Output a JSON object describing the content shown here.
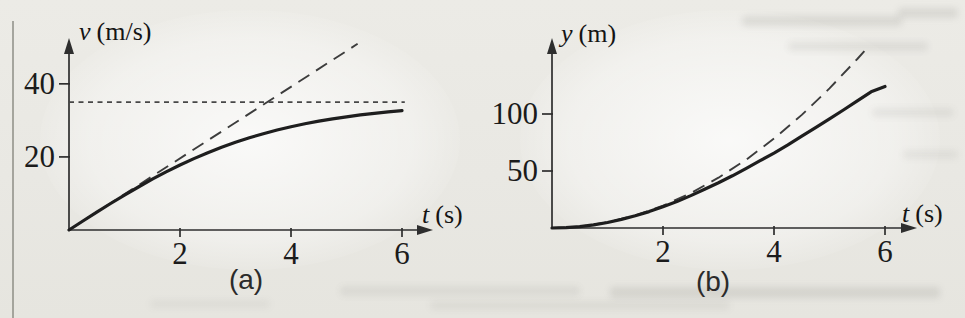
{
  "chart_data": [
    {
      "type": "line",
      "panel": "(a)",
      "xlabel_var": "t",
      "xlabel_unit": "(s)",
      "ylabel_var": "v",
      "ylabel_unit": "(m/s)",
      "xticks": [
        2,
        4,
        6
      ],
      "yticks": [
        20,
        40
      ],
      "xlim": [
        0,
        6.5
      ],
      "ylim": [
        0,
        52.5
      ],
      "grid": false,
      "legend": "none",
      "series": [
        {
          "name": "long-dashed-line",
          "style": "long-dash",
          "x": [
            0,
            5.2
          ],
          "y": [
            0,
            50.96
          ]
        },
        {
          "name": "dotted-horizontal-line",
          "style": "dotted",
          "x": [
            0,
            6.05
          ],
          "y": [
            35,
            35
          ]
        },
        {
          "name": "solid-curve",
          "style": "solid",
          "x": [
            0,
            0.25,
            0.5,
            0.75,
            1,
            1.25,
            1.5,
            1.75,
            2,
            2.25,
            2.5,
            2.75,
            3,
            3.25,
            3.5,
            3.75,
            4,
            4.25,
            4.5,
            4.75,
            5,
            5.25,
            5.5,
            5.75,
            6
          ],
          "y": [
            0,
            2.45,
            4.87,
            7.24,
            9.55,
            11.77,
            13.89,
            15.9,
            17.78,
            19.53,
            21.15,
            22.64,
            24.0,
            25.24,
            26.36,
            27.36,
            28.27,
            29.07,
            29.79,
            30.42,
            30.99,
            31.49,
            31.92,
            32.31,
            32.65
          ]
        }
      ]
    },
    {
      "type": "line",
      "panel": "(b)",
      "xlabel_var": "t",
      "xlabel_unit": "(s)",
      "ylabel_var": "y",
      "ylabel_unit": "(m)",
      "xticks": [
        2,
        4,
        6
      ],
      "yticks": [
        50,
        100
      ],
      "xlim": [
        0,
        6.55
      ],
      "ylim": [
        0,
        166
      ],
      "grid": false,
      "legend": "none",
      "series": [
        {
          "name": "long-dashed-curve",
          "style": "long-dash",
          "x": [
            0,
            0.5,
            1,
            1.5,
            2,
            2.5,
            3,
            3.5,
            4,
            4.5,
            5,
            5.5,
            5.7
          ],
          "y": [
            0,
            1.23,
            4.9,
            11.03,
            19.6,
            30.63,
            44.1,
            60.03,
            78.4,
            99.23,
            122.5,
            148.23,
            159.23
          ]
        },
        {
          "name": "solid-curve",
          "style": "solid",
          "x": [
            0,
            0.25,
            0.5,
            0.75,
            1,
            1.25,
            1.5,
            1.75,
            2,
            2.25,
            2.5,
            2.75,
            3,
            3.25,
            3.5,
            3.75,
            4,
            4.25,
            4.5,
            4.75,
            5,
            5.25,
            5.5,
            5.75,
            6
          ],
          "y": [
            0,
            0.31,
            1.22,
            2.74,
            4.84,
            7.53,
            10.66,
            14.35,
            18.65,
            23.2,
            28.41,
            34.03,
            39.73,
            45.82,
            52.33,
            59.05,
            65.73,
            72.93,
            80.53,
            88.07,
            95.74,
            103.55,
            111.47,
            119.5,
            124.09
          ]
        }
      ]
    }
  ],
  "colors": {
    "axis": "#2e2e2e",
    "solid_curve": "#1e1e1e",
    "dashed_curve": "#3c3c3c",
    "dotted_line": "#474747",
    "page_background": "#e9e8e3"
  }
}
